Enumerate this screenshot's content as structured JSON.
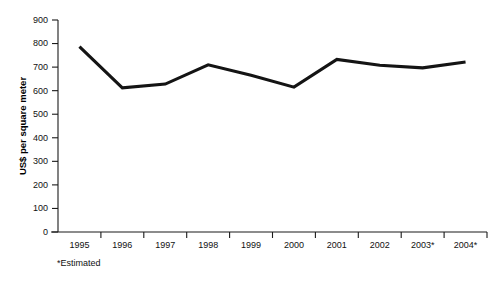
{
  "chart_data": {
    "type": "line",
    "title": "",
    "subtitle": "",
    "xlabel": "",
    "ylabel": "US$ per square meter",
    "categories": [
      "1995",
      "1996",
      "1997",
      "1998",
      "1999",
      "2000",
      "2001",
      "2002",
      "2003*",
      "2004*"
    ],
    "values": [
      787,
      612,
      628,
      710,
      665,
      615,
      733,
      708,
      697,
      722
    ],
    "series": [
      {
        "name": "US$ per square meter",
        "values": [
          787,
          612,
          628,
          710,
          665,
          615,
          733,
          708,
          697,
          722
        ]
      }
    ],
    "ylim": [
      0,
      900
    ],
    "yticks": [
      0,
      100,
      200,
      300,
      400,
      500,
      600,
      700,
      800,
      900
    ],
    "ytick_labels": [
      "0",
      "100",
      "200",
      "300",
      "400",
      "500",
      "600",
      "700",
      "800",
      "900"
    ],
    "grid": false,
    "legend": false,
    "legend_position": "none",
    "line_color": "#141414",
    "axis_color": "#1a1a1a",
    "background_color": "#ffffff",
    "annotations": [
      {
        "name": "footnote",
        "text": "*Estimated"
      }
    ]
  },
  "footnote": {
    "text": "*Estimated"
  },
  "axes": {
    "y_title": "US$ per square meter"
  }
}
